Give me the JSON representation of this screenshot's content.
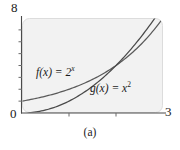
{
  "figure": {
    "caption": "(a)",
    "panel_bg": "#f2f2f2",
    "panel_border": "#d8d8d8",
    "axis_color": "#4a4a4a",
    "text_color": "#1a1a1a"
  },
  "chart_data": {
    "type": "line",
    "title": "",
    "subtitle": "",
    "xlabel": "",
    "ylabel": "",
    "xlim": [
      0,
      3
    ],
    "ylim": [
      0,
      8
    ],
    "grid": false,
    "legend": "inline-annotations",
    "x_tick_labels": [
      "0",
      "3"
    ],
    "y_tick_labels": [
      "0",
      "8"
    ],
    "x_minor_ticks": [
      1,
      2
    ],
    "y_minor_ticks": [
      1,
      2,
      3,
      4,
      5,
      6,
      7
    ],
    "series": [
      {
        "name": "f(x) = 2^x",
        "label_base": "f(x) = 2",
        "label_exp": "x",
        "color": "#555555",
        "x": [
          0,
          0.25,
          0.5,
          0.75,
          1,
          1.25,
          1.5,
          1.75,
          2,
          2.25,
          2.5,
          2.75,
          3
        ],
        "values": [
          1,
          1.19,
          1.41,
          1.68,
          2,
          2.38,
          2.83,
          3.36,
          4,
          4.76,
          5.66,
          6.73,
          8
        ]
      },
      {
        "name": "g(x) = x^2",
        "label_base": "g(x) = x",
        "label_exp": "2",
        "color": "#555555",
        "x": [
          0,
          0.25,
          0.5,
          0.75,
          1,
          1.25,
          1.5,
          1.75,
          2,
          2.25,
          2.5,
          2.75,
          3
        ],
        "values": [
          0,
          0.0625,
          0.25,
          0.5625,
          1,
          1.5625,
          2.25,
          3.0625,
          4,
          5.0625,
          6.25,
          7.5625,
          9
        ]
      }
    ],
    "annotations": [
      {
        "text": "f(x) = 2^x",
        "x": 0.35,
        "y": 3.3
      },
      {
        "text": "g(x) = x^2",
        "x": 1.55,
        "y": 2.0
      }
    ]
  }
}
